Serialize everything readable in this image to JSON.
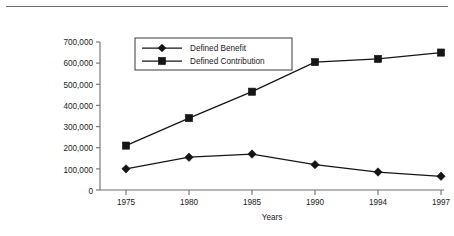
{
  "figure": {
    "background_color": "#ffffff",
    "rule_color": "#6e6e6e",
    "ink_color": "#151515"
  },
  "chart_data": {
    "type": "line",
    "title": "",
    "subtitle": "",
    "xlabel": "Years",
    "ylabel": "",
    "categories": [
      "1975",
      "1980",
      "1985",
      "1990",
      "1994",
      "1997"
    ],
    "x": [
      1975,
      1980,
      1985,
      1990,
      1994,
      1997
    ],
    "series": [
      {
        "name": "Defined Benefit",
        "marker": "diamond",
        "color": "#151515",
        "values": [
          100000,
          155000,
          170000,
          120000,
          85000,
          65000
        ]
      },
      {
        "name": "Defined Contribution",
        "marker": "square",
        "color": "#151515",
        "values": [
          210000,
          340000,
          465000,
          605000,
          620000,
          650000
        ]
      }
    ],
    "ylim": [
      0,
      700000
    ],
    "yticks": [
      0,
      100000,
      200000,
      300000,
      400000,
      500000,
      600000,
      700000
    ],
    "ytick_labels": [
      "0",
      "100,000",
      "200,000",
      "300,000",
      "400,000",
      "500,000",
      "600,000",
      "700,000"
    ],
    "xtick_labels": [
      "1975",
      "1980",
      "1985",
      "1990",
      "1994",
      "1997"
    ],
    "grid": false,
    "legend_position": "upper-left-inside",
    "legend_entries": [
      "Defined Benefit",
      "Defined Contribution"
    ]
  }
}
